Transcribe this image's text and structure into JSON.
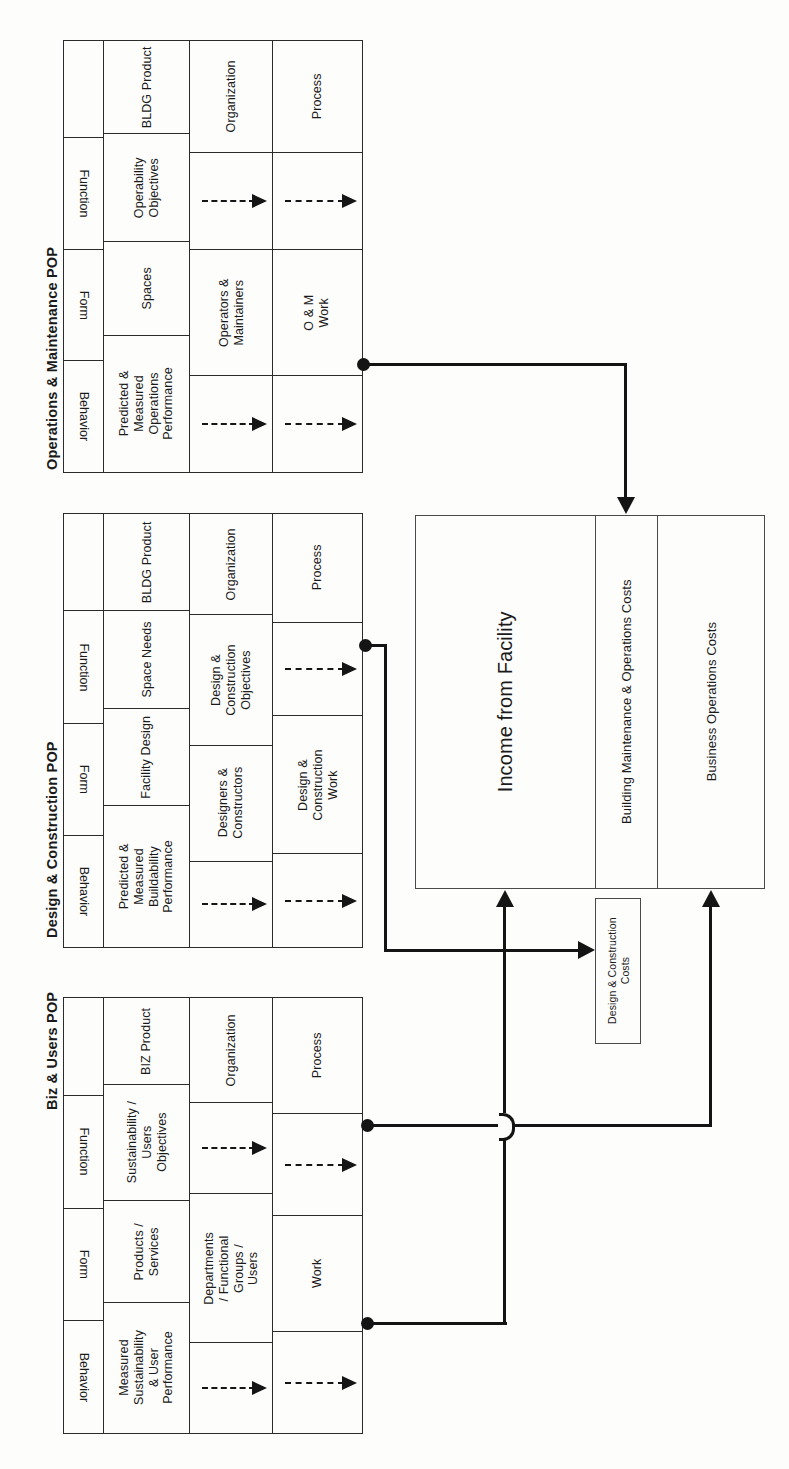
{
  "diagram": {
    "orientation": "rotated-90-ccw",
    "line_color": "#141414",
    "box_border_color": "#4a4a4a",
    "axis_labels": [
      "Function",
      "Form",
      "Behavior"
    ],
    "column_headers": [
      "Product",
      "Organization",
      "Process"
    ],
    "tables": [
      {
        "id": "om-pop",
        "title": "Operations & Maintenance POP",
        "headers": [
          "",
          "BLDG Product",
          "Organization",
          "Process"
        ],
        "rows": [
          {
            "axis": "Function",
            "product": "Operability\nObjectives",
            "organization": "dashed-arrow",
            "process": "dashed-arrow"
          },
          {
            "axis": "Form",
            "product": "Spaces",
            "organization": "Operators &\nMaintainers",
            "process": "O & M\nWork"
          },
          {
            "axis": "Behavior",
            "product": "Predicted &\nMeasured\nOperations\nPerformance",
            "organization": "dashed-arrow",
            "process": "dashed-arrow"
          }
        ]
      },
      {
        "id": "dc-pop",
        "title": "Design & Construction POP",
        "headers": [
          "",
          "BLDG Product",
          "Organization",
          "Process"
        ],
        "rows": [
          {
            "axis": "Function",
            "product": "Space Needs",
            "organization": "Design &\nConstruction\nObjectives",
            "process": "dashed-arrow"
          },
          {
            "axis": "Form",
            "product": "Facility Design",
            "organization": "Designers &\nConstructors",
            "process": "Design &\nConstruction\nWork"
          },
          {
            "axis": "Behavior",
            "product": "Predicted &\nMeasured\nBuildability\nPerformance",
            "organization": "dashed-arrow",
            "process": "dashed-arrow"
          }
        ]
      },
      {
        "id": "biz-pop",
        "title": "Biz & Users POP",
        "headers": [
          "",
          "BIZ Product",
          "Organization",
          "Process"
        ],
        "rows": [
          {
            "axis": "Function",
            "product": "Sustainability /\nUsers\nObjectives",
            "organization": "dashed-arrow",
            "process": "dashed-arrow"
          },
          {
            "axis": "Form",
            "product": "Products /\nServices",
            "organization": "Departments\n/ Functional\nGroups /\nUsers",
            "process": "Work"
          },
          {
            "axis": "Behavior",
            "product": "Measured\nSustainability\n& User\nPerformance",
            "organization": "dashed-arrow",
            "process": "dashed-arrow"
          }
        ]
      }
    ],
    "money_box": {
      "segments": [
        "Income from Facility",
        "Building Maintenance & Operations Costs",
        "Business Operations Costs"
      ]
    },
    "cost_box": {
      "label": "Design & Construction\nCosts"
    },
    "connectors": [
      {
        "name": "om-behavior-to-building-maint-costs",
        "from": "Operations & Maintenance POP / Behavior / Predicted & Measured Operations Performance",
        "to": "Building Maintenance & Operations Costs",
        "arrow": "down"
      },
      {
        "name": "dc-behavior-to-design-construction-costs",
        "from": "Design & Construction POP / Behavior / Predicted & Measured Buildability Performance",
        "to": "Design & Construction Costs",
        "arrow": "right"
      },
      {
        "name": "biz-process-to-business-operations-costs",
        "from": "Biz & Users POP / Process",
        "to": "Business Operations Costs",
        "arrow": "up"
      },
      {
        "name": "biz-behavior-to-income-from-facility",
        "from": "Biz & Users POP / Behavior / Measured Sustainability & User Performance",
        "to": "Income from Facility",
        "arrow": "up"
      }
    ]
  }
}
